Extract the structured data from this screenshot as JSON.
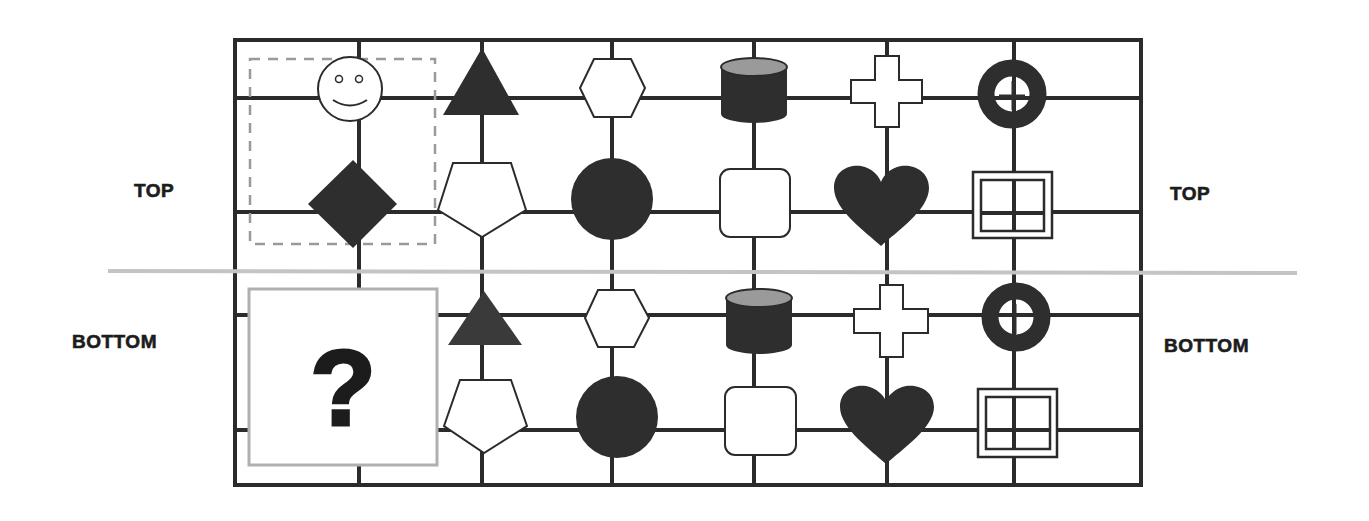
{
  "labels": {
    "top_left": "TOP",
    "top_right": "TOP",
    "bottom_left": "BOTTOM",
    "bottom_right": "BOTTOM"
  },
  "question": {
    "mark": "?"
  },
  "colors": {
    "grid_line": "#2b2b2b",
    "shape_fill_dark": "#2e2e2e",
    "shape_fill_triangle_bottom": "#3a3a3a",
    "cylinder_top": "#9a9a9a",
    "separator": "#c4c4c4",
    "dashed_box": "#9a9a9a",
    "question_box_border": "#b0b0b0",
    "background": "#ffffff"
  },
  "panels": {
    "top": {
      "row1": [
        "smiley-face",
        "filled-triangle",
        "hexagon",
        "cylinder",
        "cross",
        "ring"
      ],
      "row2": [
        "filled-diamond",
        "pentagon",
        "filled-circle",
        "rounded-square",
        "filled-heart",
        "double-square-grid"
      ],
      "highlighted_group": [
        "smiley-face",
        "filled-diamond"
      ]
    },
    "bottom": {
      "row1": [
        "question-box",
        "filled-triangle",
        "hexagon",
        "cylinder",
        "cross",
        "ring"
      ],
      "row2": [
        "question-box",
        "pentagon",
        "filled-circle",
        "rounded-square",
        "filled-heart",
        "double-square-grid"
      ]
    }
  }
}
